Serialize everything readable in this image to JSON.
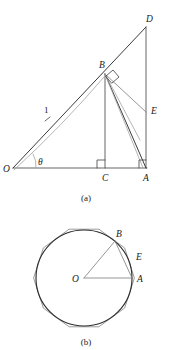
{
  "figure": {
    "title_implied": "Geometric construction: inscribed angle and circumscribed polygon",
    "panel_a": {
      "caption": "(a)",
      "points": {
        "O": {
          "label": "O",
          "x": 13,
          "y": 168
        },
        "C": {
          "label": "C",
          "x": 105,
          "y": 168
        },
        "A": {
          "label": "A",
          "x": 146,
          "y": 168
        },
        "B": {
          "label": "B",
          "x": 105,
          "y": 73
        },
        "D": {
          "label": "D",
          "x": 146,
          "y": 25
        },
        "E": {
          "label": "E",
          "x": 146,
          "y": 112
        }
      },
      "labels": {
        "O": "O",
        "A": "A",
        "B": "B",
        "C": "C",
        "D": "D",
        "E": "E",
        "radius": "1",
        "angle": "θ"
      },
      "markers": {
        "right_angle_at_C": true,
        "right_angle_at_A": true,
        "right_angle_at_B": true,
        "tick_on_OB": true
      },
      "segments": [
        {
          "name": "OA-baseline",
          "from": "O",
          "to": "A"
        },
        {
          "name": "OD-hypotenuse",
          "from": "O",
          "to": "D"
        },
        {
          "name": "AD-vertical",
          "from": "A",
          "to": "D"
        },
        {
          "name": "BC-vertical",
          "from": "B",
          "to": "C"
        },
        {
          "name": "BA",
          "from": "B",
          "to": "A"
        },
        {
          "name": "BE",
          "from": "B",
          "to": "E"
        },
        {
          "name": "OB-arc-chord",
          "from": "O",
          "to": "B"
        }
      ]
    },
    "panel_b": {
      "caption": "(b)",
      "center": {
        "label": "O",
        "x": 84,
        "y": 278
      },
      "radius": 48,
      "polygon_sides": 10,
      "labels": {
        "O": "O",
        "A": "A",
        "B": "B",
        "E": "E"
      },
      "points": {
        "O": {
          "label": "O",
          "x": 84,
          "y": 278
        },
        "A": {
          "label": "A",
          "x": 132,
          "y": 278
        },
        "B": {
          "label": "B",
          "x": 117,
          "y": 240
        },
        "E": {
          "label": "E",
          "x": 136,
          "y": 258
        }
      },
      "segments": [
        {
          "name": "OA-radius",
          "from": "O",
          "to": "A"
        },
        {
          "name": "OB-radius",
          "from": "O",
          "to": "B"
        },
        {
          "name": "BA-chord",
          "from": "B",
          "to": "A"
        }
      ]
    },
    "colors": {
      "ink": "#1a1a1a",
      "line_dark": "#4a4a4a",
      "line_mid": "#7b7b7b",
      "line_light": "#9d9d9d",
      "circle": "#2e2e2e",
      "polygon": "#8a8a8a",
      "background": "#ffffff"
    }
  }
}
